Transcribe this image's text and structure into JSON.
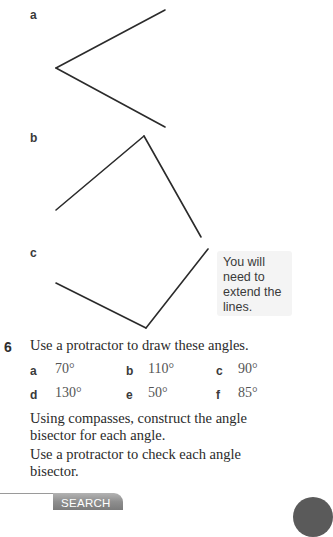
{
  "exercise_5": {
    "parts": [
      {
        "label": "a"
      },
      {
        "label": "b"
      },
      {
        "label": "c"
      }
    ],
    "note": "You will need to extend the lines."
  },
  "exercise_6": {
    "number": "6",
    "instruction": "Use a protractor to draw these angles.",
    "angles": [
      {
        "label": "a",
        "value": "70°"
      },
      {
        "label": "b",
        "value": "110°"
      },
      {
        "label": "c",
        "value": "90°"
      },
      {
        "label": "d",
        "value": "130°"
      },
      {
        "label": "e",
        "value": "50°"
      },
      {
        "label": "f",
        "value": "85°"
      }
    ],
    "bisector_text_line1": "Using compasses, construct the angle",
    "bisector_text_line2": "bisector for each angle.",
    "check_text_line1": "Use a protractor to check each angle",
    "check_text_line2": "bisector."
  },
  "search": {
    "input_value": "",
    "button_label": "SEARCH"
  }
}
